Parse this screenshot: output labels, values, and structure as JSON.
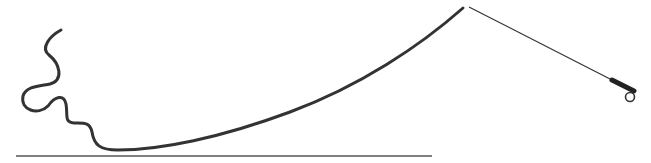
{
  "diagram": {
    "elements": [
      "ground-line",
      "fly-line",
      "leader-tippet",
      "fly-rod",
      "rod-handle",
      "reel"
    ],
    "colors": {
      "background": "#ffffff",
      "stroke": "#333333",
      "ground": "#555555"
    }
  }
}
